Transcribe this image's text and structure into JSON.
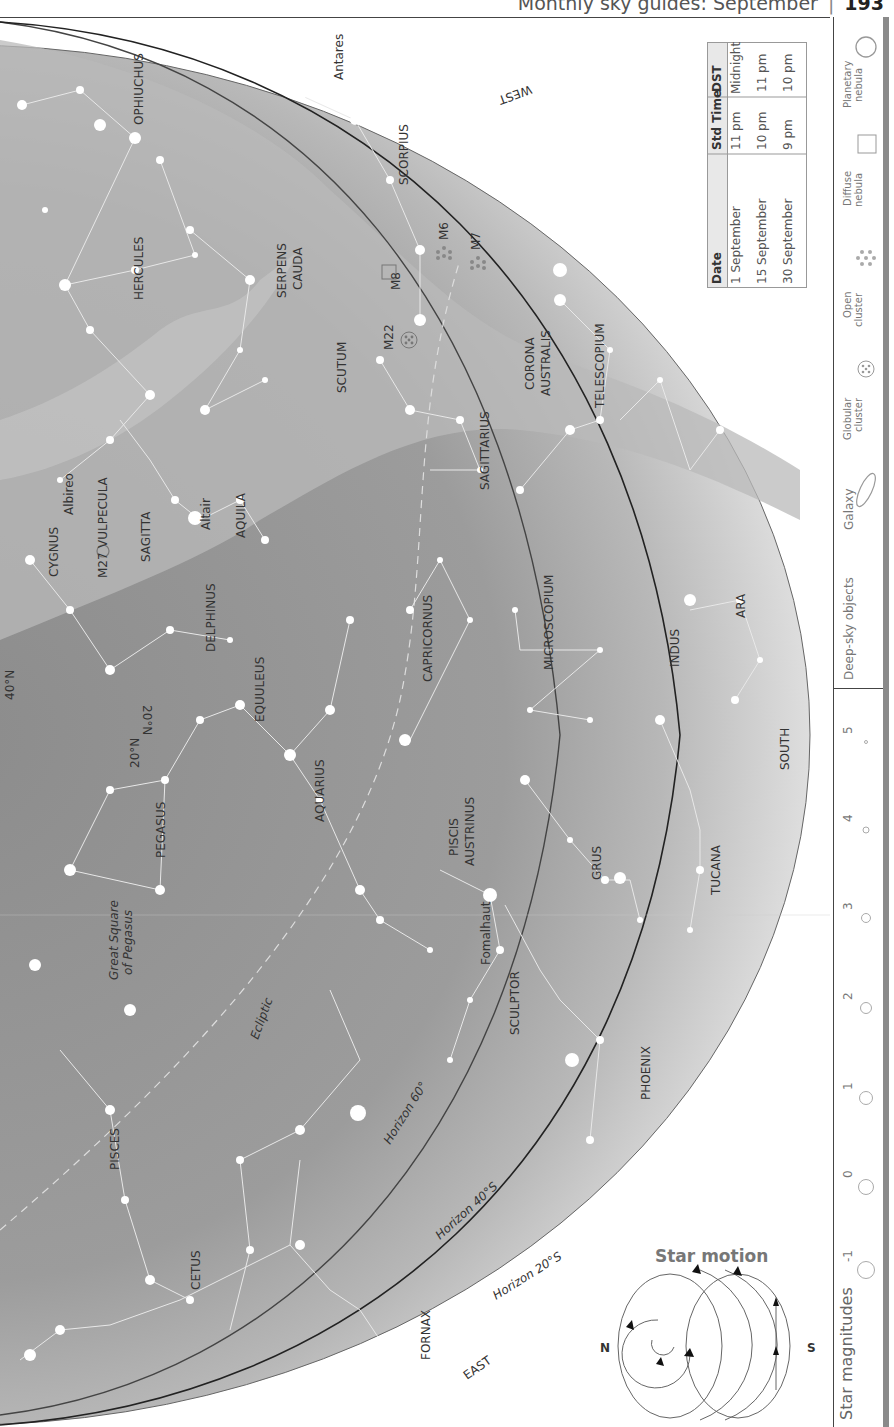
{
  "header": {
    "title": "Monthly sky guides: September",
    "page_number": "193"
  },
  "compass": {
    "west": "WEST",
    "south": "SOUTH",
    "east": "EAST"
  },
  "horizons": {
    "h60": "Horizon 60°",
    "h40": "Horizon 40°S",
    "h20": "Horizon 20°S"
  },
  "latitude_marks": {
    "n40": "40°N",
    "n20a": "20°N",
    "n20b": "20°N"
  },
  "ecliptic": "Ecliptic",
  "constellations": [
    {
      "name": "OPHIUCHUS"
    },
    {
      "name": "HERCULES"
    },
    {
      "name": "SERPENS"
    },
    {
      "name": "CAUDA"
    },
    {
      "name": "SCORPIUS"
    },
    {
      "name": "SCUTUM"
    },
    {
      "name": "SAGITTARIUS"
    },
    {
      "name": "CORONA"
    },
    {
      "name": "AUSTRALIS"
    },
    {
      "name": "TELESCOPIUM"
    },
    {
      "name": "CYGNUS"
    },
    {
      "name": "VULPECULA"
    },
    {
      "name": "SAGITTA"
    },
    {
      "name": "AQUILA"
    },
    {
      "name": "DELPHINUS"
    },
    {
      "name": "EQUULEUS"
    },
    {
      "name": "CAPRICORNUS"
    },
    {
      "name": "MICROSCOPIUM"
    },
    {
      "name": "INDUS"
    },
    {
      "name": "ARA"
    },
    {
      "name": "PEGASUS"
    },
    {
      "name": "AQUARIUS"
    },
    {
      "name": "PISCIS"
    },
    {
      "name": "AUSTRINUS"
    },
    {
      "name": "GRUS"
    },
    {
      "name": "TUCANA"
    },
    {
      "name": "SCULPTOR"
    },
    {
      "name": "PHOENIX"
    },
    {
      "name": "PISCES"
    },
    {
      "name": "CETUS"
    },
    {
      "name": "FORNAX"
    }
  ],
  "asterisms": {
    "great_square_1": "Great Square",
    "great_square_2": "of Pegasus"
  },
  "stars": {
    "antares": "Antares",
    "albireo": "Albireo",
    "altair": "Altair",
    "fomalhaut": "Fomalhaut"
  },
  "deep_sky": {
    "m6": "M6",
    "m7": "M7",
    "m8": "M8",
    "m22": "M22",
    "m27": "M27"
  },
  "time_table": {
    "headers": [
      "Date",
      "Std Time",
      "DST"
    ],
    "rows": [
      [
        "1 September",
        "11 pm",
        "Midnight"
      ],
      [
        "15 September",
        "10 pm",
        "11 pm"
      ],
      [
        "30 September",
        "9 pm",
        "10 pm"
      ]
    ]
  },
  "legend": {
    "deep_sky_title": "Deep-sky objects",
    "galaxy": "Galaxy",
    "globular_1": "Globular",
    "globular_2": "cluster",
    "open_1": "Open",
    "open_2": "cluster",
    "diffuse_1": "Diffuse",
    "diffuse_2": "nebula",
    "planetary_1": "Planetary",
    "planetary_2": "nebula",
    "magnitudes_title": "Star magnitudes",
    "magnitudes": [
      "-1",
      "0",
      "1",
      "2",
      "3",
      "4",
      "5"
    ]
  },
  "star_motion": {
    "title": "Star motion",
    "north": "N",
    "south": "S"
  },
  "colors": {
    "sky_dark": "#8f8f8f",
    "sky_mid": "#a9a9a9",
    "sky_light": "#d8d8d8",
    "horizon_line": "#333333",
    "star": "#ffffff"
  }
}
